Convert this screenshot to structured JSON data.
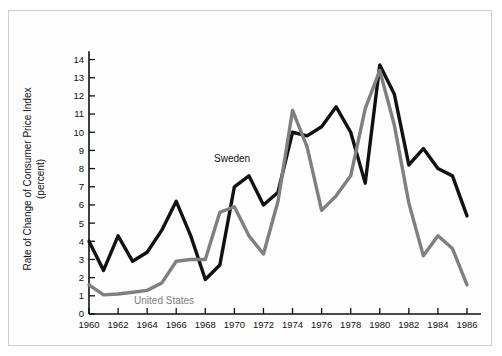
{
  "figure": {
    "background_color": "#fdfdfd",
    "border_color": "#cfcfcf"
  },
  "axis": {
    "y_title_line1": "Rate of Change of Consumer Price Index",
    "y_title_line2": "(percent)",
    "y_ticks": [
      "0",
      "1",
      "2",
      "3",
      "4",
      "5",
      "6",
      "7",
      "8",
      "9",
      "10",
      "11",
      "12",
      "13",
      "14"
    ],
    "x_ticks": [
      "1960",
      "1962",
      "1964",
      "1966",
      "1968",
      "1970",
      "1972",
      "1974",
      "1976",
      "1978",
      "1980",
      "1982",
      "1984",
      "1986"
    ]
  },
  "annotations": {
    "sweden_label": "Sweden",
    "united_states_label": "United States"
  },
  "chart_data": {
    "type": "line",
    "title": "",
    "xlabel": "",
    "ylabel": "Rate of Change of Consumer Price Index (percent)",
    "xlim": [
      1960,
      1986
    ],
    "ylim": [
      0,
      14.8
    ],
    "grid": false,
    "legend": "inline-annotations",
    "x": [
      1960,
      1961,
      1962,
      1963,
      1964,
      1965,
      1966,
      1967,
      1968,
      1969,
      1970,
      1971,
      1972,
      1973,
      1974,
      1975,
      1976,
      1977,
      1978,
      1979,
      1980,
      1981,
      1982,
      1983,
      1984,
      1985,
      1986
    ],
    "series": [
      {
        "name": "Sweden",
        "color": "#111111",
        "line_width": 3.4,
        "values": [
          4.0,
          2.4,
          4.3,
          2.9,
          3.4,
          4.6,
          6.2,
          4.3,
          1.9,
          2.7,
          7.0,
          7.6,
          6.0,
          6.7,
          10.0,
          9.8,
          10.3,
          11.4,
          10.0,
          7.2,
          13.7,
          12.1,
          8.2,
          9.1,
          8.0,
          7.6,
          5.4
        ]
      },
      {
        "name": "United States",
        "color": "#7f7f7f",
        "line_width": 3.4,
        "values": [
          1.6,
          1.05,
          1.1,
          1.2,
          1.3,
          1.7,
          2.9,
          3.0,
          3.0,
          5.6,
          5.9,
          4.3,
          3.3,
          6.2,
          11.2,
          9.2,
          5.7,
          6.5,
          7.6,
          11.3,
          13.4,
          10.4,
          6.1,
          3.2,
          4.3,
          3.6,
          1.6
        ]
      }
    ]
  }
}
